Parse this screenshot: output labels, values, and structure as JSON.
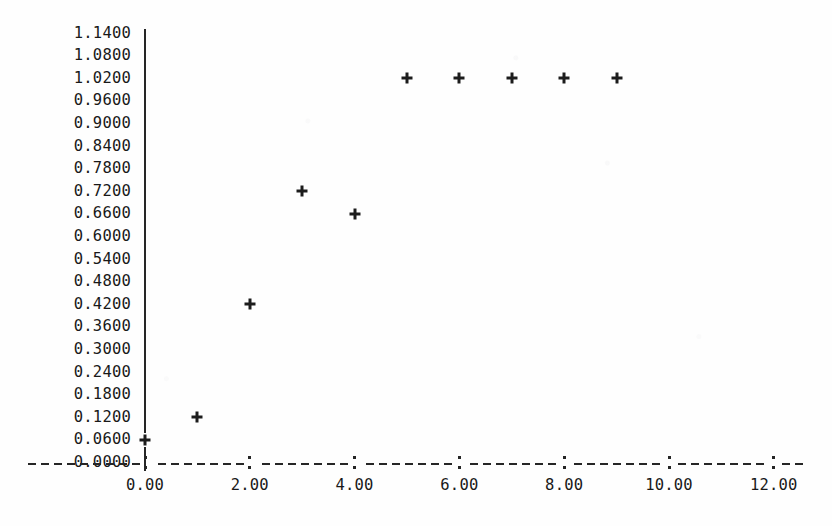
{
  "chart_data": {
    "type": "scatter",
    "title": "",
    "subtitle": "",
    "xlabel": "",
    "ylabel": "",
    "marker": "+",
    "grid": false,
    "legend": null,
    "xlim": [
      -0.65,
      12.9
    ],
    "ylim": [
      0.0,
      1.14
    ],
    "x": [
      0,
      1,
      2,
      3,
      4,
      5,
      6,
      7,
      8,
      9
    ],
    "y": [
      0.06,
      0.12,
      0.42,
      0.72,
      0.66,
      1.02,
      1.02,
      1.02,
      1.02,
      1.02
    ],
    "points": [
      {
        "x": 0,
        "y": 0.06
      },
      {
        "x": 1,
        "y": 0.12
      },
      {
        "x": 2,
        "y": 0.42
      },
      {
        "x": 3,
        "y": 0.72
      },
      {
        "x": 4,
        "y": 0.66
      },
      {
        "x": 5,
        "y": 1.02
      },
      {
        "x": 6,
        "y": 1.02
      },
      {
        "x": 7,
        "y": 1.02
      },
      {
        "x": 8,
        "y": 1.02
      },
      {
        "x": 9,
        "y": 1.02
      }
    ],
    "y_tick_labels": [
      "1.1400",
      "1.0800",
      "1.0200",
      "0.9600",
      "0.9000",
      "0.8400",
      "0.7800",
      "0.7200",
      "0.6600",
      "0.6000",
      "0.5400",
      "0.4800",
      "0.4200",
      "0.3600",
      "0.3000",
      "0.2400",
      "0.1800",
      "0.1200",
      "0.0600",
      "0.0000"
    ],
    "y_tick_values": [
      1.14,
      1.08,
      1.02,
      0.96,
      0.9,
      0.84,
      0.78,
      0.72,
      0.66,
      0.6,
      0.54,
      0.48,
      0.42,
      0.36,
      0.3,
      0.24,
      0.18,
      0.12,
      0.06,
      0.0
    ],
    "x_tick_labels": [
      "0.00",
      "2.00",
      "4.00",
      "6.00",
      "8.00",
      "10.00",
      "12.00"
    ],
    "x_tick_values": [
      0,
      2,
      4,
      6,
      8,
      10,
      12
    ],
    "colors": {
      "background": "#fefefe",
      "axis": "#262626",
      "text": "#191919",
      "marker": "#1c1c1c"
    }
  }
}
